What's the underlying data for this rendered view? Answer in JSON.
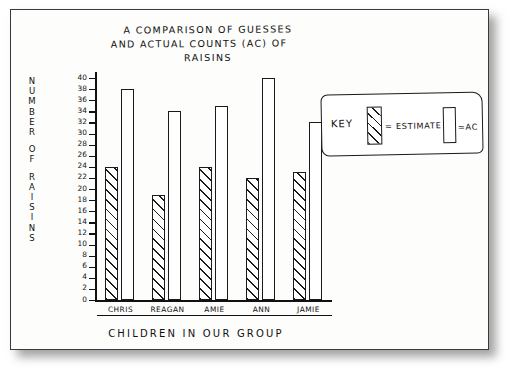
{
  "chart_data": {
    "type": "bar",
    "title": "A COMPARISON OF GUESSES AND ACTUAL COUNTS (AC) OF RAISINS",
    "title_lines": [
      "A COMPARISON OF GUESSES",
      "AND ACTUAL COUNTS (AC) OF",
      "RAISINS"
    ],
    "xlabel": "CHILDREN IN OUR GROUP",
    "ylabel": "NUMBER OF RAISINS",
    "ylabel_words": [
      "NUMBER",
      "OF",
      "RAISINS"
    ],
    "categories": [
      "CHRIS",
      "REAGAN",
      "AMIE",
      "ANN",
      "JAMIE"
    ],
    "series": [
      {
        "name": "ESTIMATE",
        "values": [
          24,
          19,
          24,
          22,
          23
        ],
        "fill": "hatched"
      },
      {
        "name": "AC",
        "values": [
          38,
          34,
          35,
          40,
          32
        ],
        "fill": "white"
      }
    ],
    "ylim": [
      0,
      40
    ],
    "ytick_step": 2,
    "yticks": [
      40,
      38,
      36,
      34,
      32,
      30,
      28,
      26,
      24,
      22,
      20,
      18,
      16,
      14,
      12,
      10,
      8,
      6,
      4,
      2,
      0
    ],
    "grid": false,
    "legend_position": "upper-right-box"
  },
  "key": {
    "label": "KEY",
    "estimate_eq": "= ESTIMATE",
    "ac_eq": "=AC"
  },
  "colors": {
    "ink": "#1a1a1a",
    "paper": "#fdfdfc",
    "border": "#3a3a3a"
  }
}
